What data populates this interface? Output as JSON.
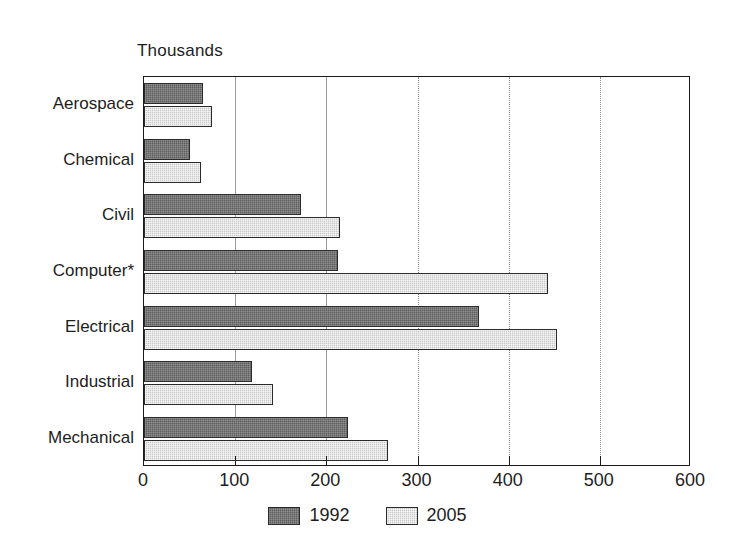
{
  "chart_data": {
    "type": "bar",
    "orientation": "horizontal",
    "title": "",
    "subtitle": "",
    "unit_caption": "Thousands",
    "xlabel": "",
    "ylabel": "",
    "xlim": [
      0,
      600
    ],
    "xticks": [
      0,
      100,
      200,
      300,
      400,
      500,
      600
    ],
    "xtick_labels": [
      "0",
      "100",
      "200",
      "300",
      "400",
      "500",
      "600"
    ],
    "grid": true,
    "grid_axis": "x",
    "legend_position": "bottom-center",
    "categories": [
      "Aerospace",
      "Chemical",
      "Civil",
      "Computer*",
      "Electrical",
      "Industrial",
      "Mechanical"
    ],
    "series": [
      {
        "name": "1992",
        "color": "#5e5e5e",
        "values": [
          65,
          50,
          172,
          213,
          368,
          118,
          224
        ]
      },
      {
        "name": "2005",
        "color": "#c9c9c9",
        "values": [
          75,
          62,
          215,
          443,
          453,
          142,
          268
        ]
      }
    ],
    "annotations": [
      "Computer*"
    ]
  },
  "legend": {
    "items": [
      {
        "label": "1992",
        "swatch": "dark-gray-swatch"
      },
      {
        "label": "2005",
        "swatch": "light-gray-swatch"
      }
    ]
  },
  "axis": {
    "unit_caption": "Thousands",
    "tick_labels": [
      "0",
      "100",
      "200",
      "300",
      "400",
      "500",
      "600"
    ]
  },
  "colors": {
    "series_1992": "#5e5e5e",
    "series_2005": "#c9c9c9",
    "frame": "#1a1a1a",
    "gridline": "#8d8d8d",
    "text": "#1d1d1d",
    "background": "#ffffff"
  }
}
